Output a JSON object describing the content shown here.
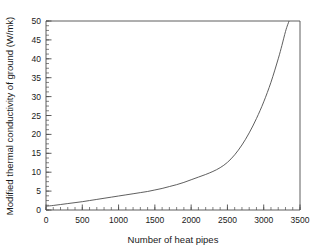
{
  "chart_data": {
    "type": "line",
    "title": "",
    "xlabel": "Number of heat pipes",
    "ylabel": "Modified thermal conductivity of ground (W/mk)",
    "xlim": [
      0,
      3500
    ],
    "ylim": [
      0,
      50
    ],
    "xticks": [
      0,
      500,
      1000,
      1500,
      2000,
      2500,
      3000,
      3500
    ],
    "xtick_labels": [
      "0",
      "500",
      "1000",
      "1500",
      "2000",
      "2500",
      "3000",
      "3500"
    ],
    "yticks": [
      0,
      5,
      10,
      15,
      20,
      25,
      30,
      35,
      40,
      45,
      50
    ],
    "ytick_labels": [
      "0",
      "5",
      "10",
      "15",
      "20",
      "25",
      "30",
      "35",
      "40",
      "45",
      "50"
    ],
    "x_minor_step": 100,
    "y_minor_step": 1.25,
    "grid": false,
    "legend": false,
    "line_color": "#4d4d4d",
    "line_width": 0.9,
    "frame_color": "#4d4d4d",
    "background": "#ffffff",
    "series": [
      {
        "name": "Modified thermal conductivity of ground",
        "x": [
          0,
          100,
          200,
          300,
          400,
          500,
          600,
          700,
          800,
          900,
          1000,
          1100,
          1200,
          1300,
          1400,
          1500,
          1600,
          1700,
          1800,
          1900,
          2000,
          2100,
          2200,
          2300,
          2400,
          2500,
          2600,
          2700,
          2800,
          2900,
          3000,
          3100,
          3200,
          3250,
          3300,
          3330,
          3350
        ],
        "y": [
          1.0,
          1.2,
          1.45,
          1.7,
          1.95,
          2.2,
          2.5,
          2.8,
          3.1,
          3.4,
          3.7,
          4.0,
          4.3,
          4.6,
          4.9,
          5.3,
          5.7,
          6.2,
          6.7,
          7.3,
          8.0,
          8.7,
          9.4,
          10.2,
          11.2,
          12.6,
          14.6,
          17.2,
          20.4,
          24.2,
          28.6,
          33.8,
          40.0,
          43.5,
          47.2,
          49.0,
          50.0
        ]
      }
    ],
    "annotations": []
  }
}
